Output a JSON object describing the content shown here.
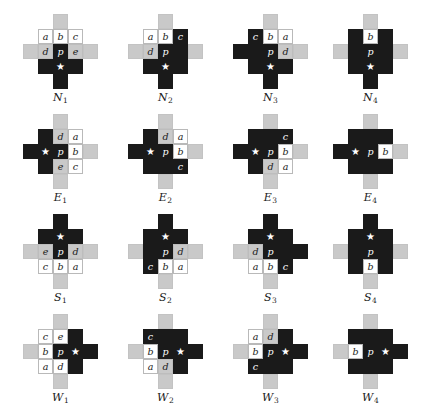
{
  "figure": {
    "cell_size": 15,
    "star_glyph": "★",
    "colors": {
      "white": "#ffffff",
      "dark": "#1a1a1a",
      "gray": "#c9c9c9",
      "arm": "#c9c9c9",
      "text": "#1a1a1a",
      "background": "#ffffff"
    },
    "columns": 4,
    "rows": 4,
    "row_labels": [
      "N",
      "E",
      "S",
      "W"
    ]
  },
  "diagrams": [
    {
      "name": "N1",
      "label_letter": "N",
      "label_index": "1",
      "arms": {
        "top": "gray",
        "right": "gray",
        "bottom": "dark",
        "left": "gray"
      },
      "cells": [
        {
          "r": 0,
          "c": 0,
          "fill": "white",
          "text": "a"
        },
        {
          "r": 0,
          "c": 1,
          "fill": "white",
          "text": "b"
        },
        {
          "r": 0,
          "c": 2,
          "fill": "white",
          "text": "c"
        },
        {
          "r": 1,
          "c": 0,
          "fill": "gray",
          "text": "d"
        },
        {
          "r": 1,
          "c": 1,
          "fill": "dark",
          "text": "p"
        },
        {
          "r": 1,
          "c": 2,
          "fill": "gray",
          "text": "e"
        },
        {
          "r": 2,
          "c": 0,
          "fill": "dark",
          "text": ""
        },
        {
          "r": 2,
          "c": 1,
          "fill": "dark",
          "text": "★"
        },
        {
          "r": 2,
          "c": 2,
          "fill": "dark",
          "text": ""
        }
      ]
    },
    {
      "name": "N2",
      "label_letter": "N",
      "label_index": "2",
      "arms": {
        "top": "gray",
        "right": "gray",
        "bottom": "dark",
        "left": "gray"
      },
      "cells": [
        {
          "r": 0,
          "c": 0,
          "fill": "white",
          "text": "a"
        },
        {
          "r": 0,
          "c": 1,
          "fill": "white",
          "text": "b"
        },
        {
          "r": 0,
          "c": 2,
          "fill": "dark",
          "text": "c"
        },
        {
          "r": 1,
          "c": 0,
          "fill": "gray",
          "text": "d"
        },
        {
          "r": 1,
          "c": 1,
          "fill": "dark",
          "text": "p"
        },
        {
          "r": 1,
          "c": 2,
          "fill": "dark",
          "text": ""
        },
        {
          "r": 2,
          "c": 0,
          "fill": "dark",
          "text": ""
        },
        {
          "r": 2,
          "c": 1,
          "fill": "dark",
          "text": "★"
        },
        {
          "r": 2,
          "c": 2,
          "fill": "dark",
          "text": ""
        }
      ]
    },
    {
      "name": "N3",
      "label_letter": "N",
      "label_index": "3",
      "arms": {
        "top": "gray",
        "right": "gray",
        "bottom": "dark",
        "left": "dark"
      },
      "cells": [
        {
          "r": 0,
          "c": 0,
          "fill": "dark",
          "text": "c"
        },
        {
          "r": 0,
          "c": 1,
          "fill": "white",
          "text": "b"
        },
        {
          "r": 0,
          "c": 2,
          "fill": "white",
          "text": "a"
        },
        {
          "r": 1,
          "c": 0,
          "fill": "dark",
          "text": ""
        },
        {
          "r": 1,
          "c": 1,
          "fill": "dark",
          "text": "p"
        },
        {
          "r": 1,
          "c": 2,
          "fill": "gray",
          "text": "d"
        },
        {
          "r": 2,
          "c": 0,
          "fill": "dark",
          "text": ""
        },
        {
          "r": 2,
          "c": 1,
          "fill": "dark",
          "text": "★"
        },
        {
          "r": 2,
          "c": 2,
          "fill": "dark",
          "text": ""
        }
      ]
    },
    {
      "name": "N4",
      "label_letter": "N",
      "label_index": "4",
      "arms": {
        "top": "gray",
        "right": "gray",
        "bottom": "dark",
        "left": "gray"
      },
      "cells": [
        {
          "r": 0,
          "c": 0,
          "fill": "dark",
          "text": ""
        },
        {
          "r": 0,
          "c": 1,
          "fill": "white",
          "text": "b"
        },
        {
          "r": 0,
          "c": 2,
          "fill": "dark",
          "text": ""
        },
        {
          "r": 1,
          "c": 0,
          "fill": "dark",
          "text": ""
        },
        {
          "r": 1,
          "c": 1,
          "fill": "dark",
          "text": "p"
        },
        {
          "r": 1,
          "c": 2,
          "fill": "dark",
          "text": ""
        },
        {
          "r": 2,
          "c": 0,
          "fill": "dark",
          "text": ""
        },
        {
          "r": 2,
          "c": 1,
          "fill": "dark",
          "text": "★"
        },
        {
          "r": 2,
          "c": 2,
          "fill": "dark",
          "text": ""
        }
      ]
    },
    {
      "name": "E1",
      "label_letter": "E",
      "label_index": "1",
      "arms": {
        "top": "gray",
        "right": "gray",
        "bottom": "gray",
        "left": "dark"
      },
      "cells": [
        {
          "r": 0,
          "c": 0,
          "fill": "dark",
          "text": ""
        },
        {
          "r": 0,
          "c": 1,
          "fill": "gray",
          "text": "d"
        },
        {
          "r": 0,
          "c": 2,
          "fill": "white",
          "text": "a"
        },
        {
          "r": 1,
          "c": 0,
          "fill": "dark",
          "text": "★"
        },
        {
          "r": 1,
          "c": 1,
          "fill": "dark",
          "text": "p"
        },
        {
          "r": 1,
          "c": 2,
          "fill": "white",
          "text": "b"
        },
        {
          "r": 2,
          "c": 0,
          "fill": "dark",
          "text": ""
        },
        {
          "r": 2,
          "c": 1,
          "fill": "gray",
          "text": "e"
        },
        {
          "r": 2,
          "c": 2,
          "fill": "white",
          "text": "c"
        }
      ]
    },
    {
      "name": "E2",
      "label_letter": "E",
      "label_index": "2",
      "arms": {
        "top": "gray",
        "right": "gray",
        "bottom": "gray",
        "left": "dark"
      },
      "cells": [
        {
          "r": 0,
          "c": 0,
          "fill": "dark",
          "text": ""
        },
        {
          "r": 0,
          "c": 1,
          "fill": "gray",
          "text": "d"
        },
        {
          "r": 0,
          "c": 2,
          "fill": "white",
          "text": "a"
        },
        {
          "r": 1,
          "c": 0,
          "fill": "dark",
          "text": "★"
        },
        {
          "r": 1,
          "c": 1,
          "fill": "dark",
          "text": "p"
        },
        {
          "r": 1,
          "c": 2,
          "fill": "white",
          "text": "b"
        },
        {
          "r": 2,
          "c": 0,
          "fill": "dark",
          "text": ""
        },
        {
          "r": 2,
          "c": 1,
          "fill": "dark",
          "text": ""
        },
        {
          "r": 2,
          "c": 2,
          "fill": "dark",
          "text": "c"
        }
      ]
    },
    {
      "name": "E3",
      "label_letter": "E",
      "label_index": "3",
      "arms": {
        "top": "gray",
        "right": "gray",
        "bottom": "gray",
        "left": "dark"
      },
      "cells": [
        {
          "r": 0,
          "c": 0,
          "fill": "dark",
          "text": ""
        },
        {
          "r": 0,
          "c": 1,
          "fill": "dark",
          "text": ""
        },
        {
          "r": 0,
          "c": 2,
          "fill": "dark",
          "text": "c"
        },
        {
          "r": 1,
          "c": 0,
          "fill": "dark",
          "text": "★"
        },
        {
          "r": 1,
          "c": 1,
          "fill": "dark",
          "text": "p"
        },
        {
          "r": 1,
          "c": 2,
          "fill": "white",
          "text": "b"
        },
        {
          "r": 2,
          "c": 0,
          "fill": "dark",
          "text": ""
        },
        {
          "r": 2,
          "c": 1,
          "fill": "gray",
          "text": "d"
        },
        {
          "r": 2,
          "c": 2,
          "fill": "white",
          "text": "a"
        }
      ]
    },
    {
      "name": "E4",
      "label_letter": "E",
      "label_index": "4",
      "arms": {
        "top": "gray",
        "right": "gray",
        "bottom": "gray",
        "left": "dark"
      },
      "cells": [
        {
          "r": 0,
          "c": 0,
          "fill": "dark",
          "text": ""
        },
        {
          "r": 0,
          "c": 1,
          "fill": "dark",
          "text": ""
        },
        {
          "r": 0,
          "c": 2,
          "fill": "dark",
          "text": ""
        },
        {
          "r": 1,
          "c": 0,
          "fill": "dark",
          "text": "★"
        },
        {
          "r": 1,
          "c": 1,
          "fill": "dark",
          "text": "p"
        },
        {
          "r": 1,
          "c": 2,
          "fill": "white",
          "text": "b"
        },
        {
          "r": 2,
          "c": 0,
          "fill": "dark",
          "text": ""
        },
        {
          "r": 2,
          "c": 1,
          "fill": "dark",
          "text": ""
        },
        {
          "r": 2,
          "c": 2,
          "fill": "dark",
          "text": ""
        }
      ]
    },
    {
      "name": "S1",
      "label_letter": "S",
      "label_index": "1",
      "arms": {
        "top": "dark",
        "right": "gray",
        "bottom": "gray",
        "left": "gray"
      },
      "cells": [
        {
          "r": 0,
          "c": 0,
          "fill": "dark",
          "text": ""
        },
        {
          "r": 0,
          "c": 1,
          "fill": "dark",
          "text": "★"
        },
        {
          "r": 0,
          "c": 2,
          "fill": "dark",
          "text": ""
        },
        {
          "r": 1,
          "c": 0,
          "fill": "gray",
          "text": "e"
        },
        {
          "r": 1,
          "c": 1,
          "fill": "dark",
          "text": "p"
        },
        {
          "r": 1,
          "c": 2,
          "fill": "gray",
          "text": "d"
        },
        {
          "r": 2,
          "c": 0,
          "fill": "white",
          "text": "c"
        },
        {
          "r": 2,
          "c": 1,
          "fill": "white",
          "text": "b"
        },
        {
          "r": 2,
          "c": 2,
          "fill": "white",
          "text": "a"
        }
      ]
    },
    {
      "name": "S2",
      "label_letter": "S",
      "label_index": "2",
      "arms": {
        "top": "dark",
        "right": "gray",
        "bottom": "gray",
        "left": "gray"
      },
      "cells": [
        {
          "r": 0,
          "c": 0,
          "fill": "dark",
          "text": ""
        },
        {
          "r": 0,
          "c": 1,
          "fill": "dark",
          "text": "★"
        },
        {
          "r": 0,
          "c": 2,
          "fill": "dark",
          "text": ""
        },
        {
          "r": 1,
          "c": 0,
          "fill": "dark",
          "text": ""
        },
        {
          "r": 1,
          "c": 1,
          "fill": "dark",
          "text": "p"
        },
        {
          "r": 1,
          "c": 2,
          "fill": "gray",
          "text": "d"
        },
        {
          "r": 2,
          "c": 0,
          "fill": "dark",
          "text": "c"
        },
        {
          "r": 2,
          "c": 1,
          "fill": "white",
          "text": "b"
        },
        {
          "r": 2,
          "c": 2,
          "fill": "white",
          "text": "a"
        }
      ]
    },
    {
      "name": "S3",
      "label_letter": "S",
      "label_index": "3",
      "arms": {
        "top": "dark",
        "right": "dark",
        "bottom": "gray",
        "left": "gray"
      },
      "cells": [
        {
          "r": 0,
          "c": 0,
          "fill": "dark",
          "text": ""
        },
        {
          "r": 0,
          "c": 1,
          "fill": "dark",
          "text": "★"
        },
        {
          "r": 0,
          "c": 2,
          "fill": "dark",
          "text": ""
        },
        {
          "r": 1,
          "c": 0,
          "fill": "gray",
          "text": "d"
        },
        {
          "r": 1,
          "c": 1,
          "fill": "dark",
          "text": "p"
        },
        {
          "r": 1,
          "c": 2,
          "fill": "dark",
          "text": ""
        },
        {
          "r": 2,
          "c": 0,
          "fill": "white",
          "text": "a"
        },
        {
          "r": 2,
          "c": 1,
          "fill": "white",
          "text": "b"
        },
        {
          "r": 2,
          "c": 2,
          "fill": "dark",
          "text": "c"
        }
      ]
    },
    {
      "name": "S4",
      "label_letter": "S",
      "label_index": "4",
      "arms": {
        "top": "dark",
        "right": "gray",
        "bottom": "gray",
        "left": "gray"
      },
      "cells": [
        {
          "r": 0,
          "c": 0,
          "fill": "dark",
          "text": ""
        },
        {
          "r": 0,
          "c": 1,
          "fill": "dark",
          "text": "★"
        },
        {
          "r": 0,
          "c": 2,
          "fill": "dark",
          "text": ""
        },
        {
          "r": 1,
          "c": 0,
          "fill": "dark",
          "text": ""
        },
        {
          "r": 1,
          "c": 1,
          "fill": "dark",
          "text": "p"
        },
        {
          "r": 1,
          "c": 2,
          "fill": "dark",
          "text": ""
        },
        {
          "r": 2,
          "c": 0,
          "fill": "dark",
          "text": ""
        },
        {
          "r": 2,
          "c": 1,
          "fill": "white",
          "text": "b"
        },
        {
          "r": 2,
          "c": 2,
          "fill": "dark",
          "text": ""
        }
      ]
    },
    {
      "name": "W1",
      "label_letter": "W",
      "label_index": "1",
      "arms": {
        "top": "gray",
        "right": "dark",
        "bottom": "gray",
        "left": "gray"
      },
      "cells": [
        {
          "r": 0,
          "c": 0,
          "fill": "white",
          "text": "c"
        },
        {
          "r": 0,
          "c": 1,
          "fill": "white",
          "text": "e"
        },
        {
          "r": 0,
          "c": 2,
          "fill": "dark",
          "text": ""
        },
        {
          "r": 1,
          "c": 0,
          "fill": "white",
          "text": "b"
        },
        {
          "r": 1,
          "c": 1,
          "fill": "dark",
          "text": "p"
        },
        {
          "r": 1,
          "c": 2,
          "fill": "dark",
          "text": "★"
        },
        {
          "r": 2,
          "c": 0,
          "fill": "white",
          "text": "a"
        },
        {
          "r": 2,
          "c": 1,
          "fill": "white",
          "text": "d"
        },
        {
          "r": 2,
          "c": 2,
          "fill": "dark",
          "text": ""
        }
      ]
    },
    {
      "name": "W2",
      "label_letter": "W",
      "label_index": "2",
      "arms": {
        "top": "gray",
        "right": "dark",
        "bottom": "gray",
        "left": "gray"
      },
      "cells": [
        {
          "r": 0,
          "c": 0,
          "fill": "dark",
          "text": "c"
        },
        {
          "r": 0,
          "c": 1,
          "fill": "dark",
          "text": ""
        },
        {
          "r": 0,
          "c": 2,
          "fill": "dark",
          "text": ""
        },
        {
          "r": 1,
          "c": 0,
          "fill": "white",
          "text": "b"
        },
        {
          "r": 1,
          "c": 1,
          "fill": "dark",
          "text": "p"
        },
        {
          "r": 1,
          "c": 2,
          "fill": "dark",
          "text": "★"
        },
        {
          "r": 2,
          "c": 0,
          "fill": "white",
          "text": "a"
        },
        {
          "r": 2,
          "c": 1,
          "fill": "gray",
          "text": "d"
        },
        {
          "r": 2,
          "c": 2,
          "fill": "dark",
          "text": ""
        }
      ]
    },
    {
      "name": "W3",
      "label_letter": "W",
      "label_index": "3",
      "arms": {
        "top": "gray",
        "right": "dark",
        "bottom": "gray",
        "left": "gray"
      },
      "cells": [
        {
          "r": 0,
          "c": 0,
          "fill": "white",
          "text": "a"
        },
        {
          "r": 0,
          "c": 1,
          "fill": "gray",
          "text": "d"
        },
        {
          "r": 0,
          "c": 2,
          "fill": "dark",
          "text": ""
        },
        {
          "r": 1,
          "c": 0,
          "fill": "white",
          "text": "b"
        },
        {
          "r": 1,
          "c": 1,
          "fill": "dark",
          "text": "p"
        },
        {
          "r": 1,
          "c": 2,
          "fill": "dark",
          "text": "★"
        },
        {
          "r": 2,
          "c": 0,
          "fill": "dark",
          "text": "c"
        },
        {
          "r": 2,
          "c": 1,
          "fill": "dark",
          "text": ""
        },
        {
          "r": 2,
          "c": 2,
          "fill": "dark",
          "text": ""
        }
      ]
    },
    {
      "name": "W4",
      "label_letter": "W",
      "label_index": "4",
      "arms": {
        "top": "gray",
        "right": "dark",
        "bottom": "gray",
        "left": "gray"
      },
      "cells": [
        {
          "r": 0,
          "c": 0,
          "fill": "dark",
          "text": ""
        },
        {
          "r": 0,
          "c": 1,
          "fill": "dark",
          "text": ""
        },
        {
          "r": 0,
          "c": 2,
          "fill": "dark",
          "text": ""
        },
        {
          "r": 1,
          "c": 0,
          "fill": "white",
          "text": "b"
        },
        {
          "r": 1,
          "c": 1,
          "fill": "dark",
          "text": "p"
        },
        {
          "r": 1,
          "c": 2,
          "fill": "dark",
          "text": "★"
        },
        {
          "r": 2,
          "c": 0,
          "fill": "dark",
          "text": ""
        },
        {
          "r": 2,
          "c": 1,
          "fill": "dark",
          "text": ""
        },
        {
          "r": 2,
          "c": 2,
          "fill": "dark",
          "text": ""
        }
      ]
    }
  ]
}
